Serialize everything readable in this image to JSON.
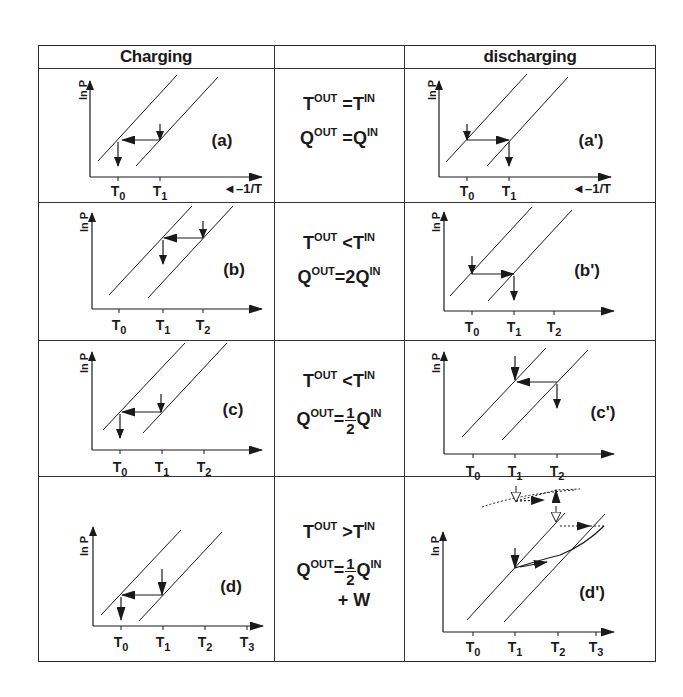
{
  "header": {
    "left": "Charging",
    "middle": "",
    "right": "discharging"
  },
  "axis": {
    "y_label": "ln P",
    "x_label": "◄–1/T"
  },
  "rows": [
    {
      "charging_label": "(a)",
      "discharging_label": "(a')",
      "ticks": [
        "T0",
        "T1"
      ],
      "equations": {
        "line1": {
          "lhs": "T",
          "lhs_sup": "OUT",
          "op": "=",
          "rhs": "T",
          "rhs_sup": "IN"
        },
        "line2": {
          "lhs": "Q",
          "lhs_sup": "OUT",
          "op": "=",
          "coef": "",
          "rhs": "Q",
          "rhs_sup": "IN"
        }
      }
    },
    {
      "charging_label": "(b)",
      "discharging_label": "(b')",
      "ticks": [
        "T0",
        "T1",
        "T2"
      ],
      "equations": {
        "line1": {
          "lhs": "T",
          "lhs_sup": "OUT",
          "op": "<",
          "rhs": "T",
          "rhs_sup": "IN"
        },
        "line2": {
          "lhs": "Q",
          "lhs_sup": "OUT",
          "op": "=",
          "coef": "2",
          "rhs": "Q",
          "rhs_sup": "IN"
        }
      }
    },
    {
      "charging_label": "(c)",
      "discharging_label": "(c')",
      "ticks": [
        "T0",
        "T1",
        "T2"
      ],
      "equations": {
        "line1": {
          "lhs": "T",
          "lhs_sup": "OUT",
          "op": "<",
          "rhs": "T",
          "rhs_sup": "IN"
        },
        "line2": {
          "lhs": "Q",
          "lhs_sup": "OUT",
          "op": "=",
          "frac_num": "1",
          "frac_den": "2",
          "rhs": "Q",
          "rhs_sup": "IN"
        }
      }
    },
    {
      "charging_label": "(d)",
      "discharging_label": "(d')",
      "ticks": [
        "T0",
        "T1",
        "T2",
        "T3"
      ],
      "equations": {
        "line1": {
          "lhs": "T",
          "lhs_sup": "OUT",
          "op": ">",
          "rhs": "T",
          "rhs_sup": "IN"
        },
        "line2": {
          "lhs": "Q",
          "lhs_sup": "OUT",
          "op": "=",
          "frac_num": "1",
          "frac_den": "2",
          "rhs": "Q",
          "rhs_sup": "IN"
        },
        "line3": "+ W"
      }
    }
  ],
  "tick_labels": {
    "T0": {
      "base": "T",
      "sub": "0"
    },
    "T1": {
      "base": "T",
      "sub": "1"
    },
    "T2": {
      "base": "T",
      "sub": "2"
    },
    "T3": {
      "base": "T",
      "sub": "3"
    }
  },
  "colors": {
    "ink": "#1a1a1a",
    "grid": "#333333",
    "background": "#ffffff"
  }
}
